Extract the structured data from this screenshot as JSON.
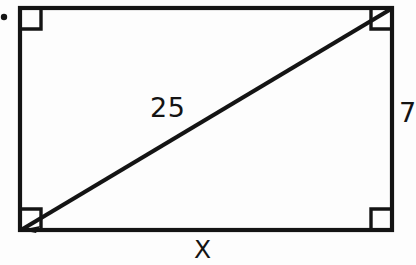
{
  "figure": {
    "type": "geometry-diagram",
    "shape": "rectangle-with-diagonal",
    "background_color": "#fdfdfd",
    "stroke_color": "#141414",
    "labels": {
      "diagonal": "25",
      "right_side": "7",
      "bottom_side": "X"
    },
    "marks": {
      "bullet_dot": "•"
    },
    "right_angle_markers": [
      "top-left",
      "top-right",
      "bottom-left",
      "bottom-right"
    ]
  }
}
